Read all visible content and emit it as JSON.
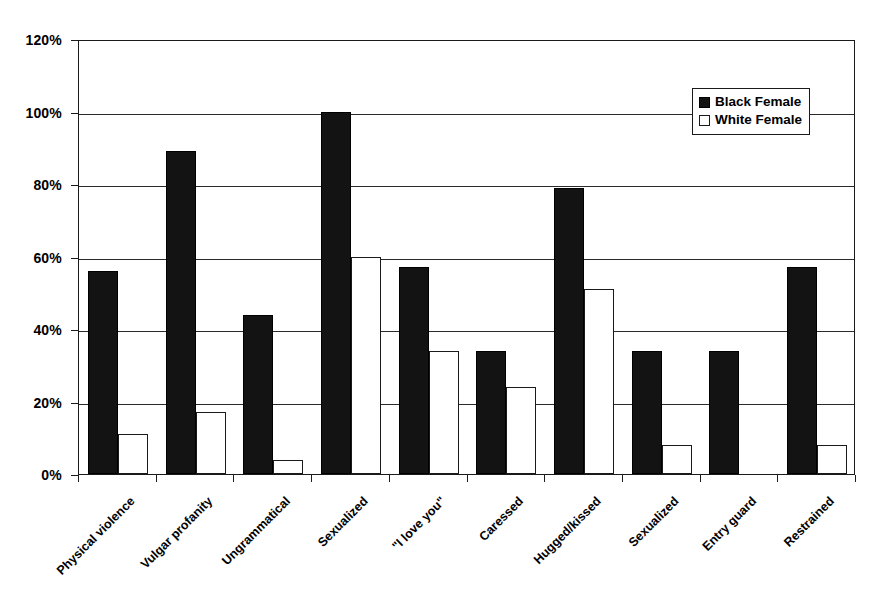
{
  "chart_data": {
    "type": "bar",
    "title": "",
    "subtitle": "",
    "xlabel": "",
    "ylabel": "",
    "ylim": [
      0,
      120
    ],
    "ytick_values": [
      0,
      20,
      40,
      60,
      80,
      100,
      120
    ],
    "ytick_labels": [
      "0%",
      "20%",
      "40%",
      "60%",
      "80%",
      "100%",
      "120%"
    ],
    "grid": true,
    "grid_axis": "y",
    "legend_position": "top-right",
    "categories": [
      "Physical violence",
      "Vulgar profanity",
      "Ungrammatical",
      "Sexualized",
      "\"I love you\"",
      "Caressed",
      "Hugged/kissed",
      "Sexualized",
      "Entry guard",
      "Restrained"
    ],
    "series": [
      {
        "name": "Black Female",
        "color": "#131313",
        "fill": "solid",
        "values": [
          56,
          89,
          44,
          100,
          57,
          34,
          79,
          34,
          34,
          57
        ]
      },
      {
        "name": "White Female",
        "color": "#ffffff",
        "fill": "open",
        "values": [
          11,
          17,
          4,
          60,
          34,
          24,
          51,
          8,
          0,
          8
        ]
      }
    ]
  },
  "legend": {
    "entries": [
      {
        "label": "Black Female",
        "swatch": "filled-square-icon"
      },
      {
        "label": "White Female",
        "swatch": "open-square-icon"
      }
    ]
  }
}
